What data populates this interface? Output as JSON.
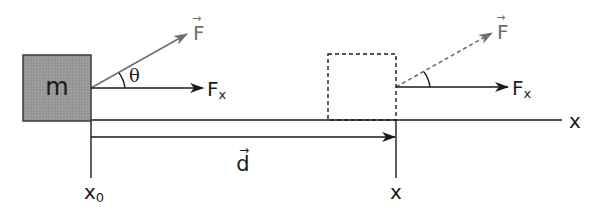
{
  "diagram": {
    "block": {
      "label": "m",
      "fill": "#9a9a9a",
      "stroke": "#3a3a3a"
    },
    "initial_position": {
      "force_label": "F",
      "force_vector_mark": "→",
      "angle_label": "θ",
      "component_label": "F",
      "component_subscript": "x",
      "position_label": "x",
      "position_subscript": "0"
    },
    "final_position": {
      "force_label": "F",
      "force_vector_mark": "→",
      "component_label": "F",
      "component_subscript": "x",
      "position_label": "x"
    },
    "displacement": {
      "label": "d",
      "vector_mark": "→"
    },
    "axis": {
      "label": "x"
    },
    "colors": {
      "line": "#1a1a1a",
      "force_arrow": "#6e6e6e",
      "block_fill": "#9a9a9a"
    }
  }
}
